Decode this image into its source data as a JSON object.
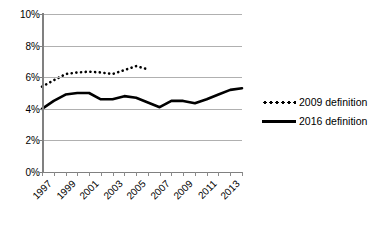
{
  "chart_data": {
    "type": "line",
    "title": "",
    "xlabel": "",
    "ylabel": "",
    "ylim": [
      0,
      10
    ],
    "yticks": [
      "0%",
      "2%",
      "4%",
      "6%",
      "8%",
      "10%"
    ],
    "ytick_values": [
      0,
      2,
      4,
      6,
      8,
      10
    ],
    "ytick_suffix": "%",
    "grid": true,
    "legend_position": "right",
    "x": [
      1997,
      1998,
      1999,
      2000,
      2001,
      2002,
      2003,
      2004,
      2005,
      2006,
      2007,
      2008,
      2009,
      2010,
      2011,
      2012,
      2013,
      2014
    ],
    "xtick_labels": [
      "1997",
      "1999",
      "2001",
      "2003",
      "2005",
      "2007",
      "2009",
      "2011",
      "2013"
    ],
    "xtick_values": [
      1997,
      1999,
      2001,
      2003,
      2005,
      2007,
      2009,
      2011,
      2013
    ],
    "xlim": [
      1997,
      2014
    ],
    "series": [
      {
        "name": "2009 definition",
        "style": "dotted",
        "color": "#000000",
        "x": [
          1997,
          1998,
          1999,
          2000,
          2001,
          2002,
          2003,
          2004,
          2005,
          2006
        ],
        "values": [
          5.4,
          5.8,
          6.2,
          6.3,
          6.35,
          6.3,
          6.2,
          6.45,
          6.7,
          6.5
        ]
      },
      {
        "name": "2016 definition",
        "style": "solid",
        "color": "#000000",
        "x": [
          1997,
          1998,
          1999,
          2000,
          2001,
          2002,
          2003,
          2004,
          2005,
          2006,
          2007,
          2008,
          2009,
          2010,
          2011,
          2012,
          2013,
          2014
        ],
        "values": [
          4.0,
          4.5,
          4.9,
          5.0,
          5.0,
          4.6,
          4.6,
          4.8,
          4.7,
          4.4,
          4.1,
          4.5,
          4.5,
          4.35,
          4.6,
          4.9,
          5.2,
          5.3
        ]
      }
    ]
  },
  "legend": {
    "items": [
      {
        "label": "2009 definition",
        "style": "dotted"
      },
      {
        "label": "2016 definition",
        "style": "solid"
      }
    ]
  }
}
